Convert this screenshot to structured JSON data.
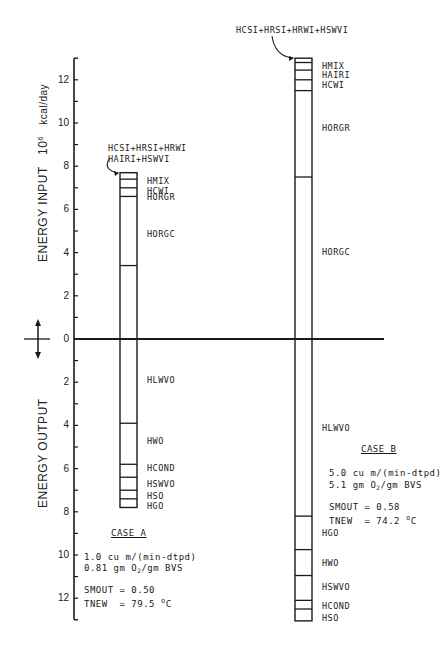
{
  "chart_data": {
    "type": "bar",
    "subtype": "stacked-energy-balance",
    "title": "",
    "ylabel_input": "ENERGY INPUT",
    "ylabel_output": "ENERGY OUTPUT",
    "yunit": "10^6 kcal/day",
    "yunit_base": "10",
    "yunit_exp": "6",
    "yunit_text": "kcal/day",
    "ylim": [
      -13,
      13
    ],
    "yticks_input": [
      0,
      2,
      4,
      6,
      8,
      10,
      12
    ],
    "yticks_output": [
      2,
      4,
      6,
      8,
      10,
      12
    ],
    "grid": false,
    "cases": [
      {
        "name": "CASE A",
        "flow": "1.0 cu m/(min-dtpd)",
        "oxygen_pre": "0.81 gm O",
        "oxygen_sub": "2",
        "oxygen_post": "/gm BVS",
        "smout": "SMOUT = 0.50",
        "tnew_pre": "TNEW  = 79.5 ",
        "tnew_sup": "o",
        "tnew_post": "C",
        "input_callout_line1": "HCSI+HRSI+HRWI",
        "input_callout_line2": "HAIRI+HSWVI",
        "input_segments": [
          {
            "label": "HORGC",
            "from": 0.0,
            "to": 3.4
          },
          {
            "label": "HORGR",
            "from": 3.4,
            "to": 6.6
          },
          {
            "label": "HCWI",
            "from": 6.6,
            "to": 7.0
          },
          {
            "label": "HMIX",
            "from": 7.0,
            "to": 7.4
          },
          {
            "label": "HCSI+HRSI+HRWI+HAIRI+HSWVI",
            "from": 7.4,
            "to": 7.7
          }
        ],
        "output_segments": [
          {
            "label": "HLWVO",
            "from": 0.0,
            "to": 3.9
          },
          {
            "label": "HWO",
            "from": 3.9,
            "to": 5.8
          },
          {
            "label": "HCOND",
            "from": 5.8,
            "to": 6.4
          },
          {
            "label": "HSWVO",
            "from": 6.4,
            "to": 7.0
          },
          {
            "label": "HSO",
            "from": 7.0,
            "to": 7.4
          },
          {
            "label": "HGO",
            "from": 7.4,
            "to": 7.8
          }
        ],
        "input_total": 7.7,
        "output_total": 7.8
      },
      {
        "name": "CASE B",
        "flow": "5.0 cu m/(min-dtpd)",
        "oxygen_pre": "5.1 gm O",
        "oxygen_sub": "2",
        "oxygen_post": "/gm BVS",
        "smout": "SMOUT = 0.58",
        "tnew_pre": "TNEW  = 74.2 ",
        "tnew_sup": "o",
        "tnew_post": "C",
        "input_callout_line1": "HCSI+HRSI+HRWI+HSWVI",
        "input_segments": [
          {
            "label": "HORGC",
            "from": 0.0,
            "to": 7.5
          },
          {
            "label": "HORGR",
            "from": 7.5,
            "to": 11.5
          },
          {
            "label": "HCWI",
            "from": 11.5,
            "to": 12.0
          },
          {
            "label": "HAIRI",
            "from": 12.0,
            "to": 12.45
          },
          {
            "label": "HMIX",
            "from": 12.45,
            "to": 12.8
          },
          {
            "label": "HCSI+HRSI+HRWI+HSWVI",
            "from": 12.8,
            "to": 13.0
          }
        ],
        "output_segments": [
          {
            "label": "HLWVO",
            "from": 0.0,
            "to": 8.2
          },
          {
            "label": "HGO",
            "from": 8.2,
            "to": 9.75
          },
          {
            "label": "HWO",
            "from": 9.75,
            "to": 10.95
          },
          {
            "label": "HSWVO",
            "from": 10.95,
            "to": 12.1
          },
          {
            "label": "HCOND",
            "from": 12.1,
            "to": 12.5
          },
          {
            "label": "HSO",
            "from": 12.5,
            "to": 13.05
          }
        ],
        "input_total": 13.0,
        "output_total": 13.05
      }
    ]
  },
  "axis": {
    "input_tick_labels": [
      "12",
      "10",
      "8",
      "6",
      "4",
      "2",
      "0"
    ],
    "output_tick_labels": [
      "2",
      "4",
      "6",
      "8",
      "10",
      "12"
    ]
  }
}
